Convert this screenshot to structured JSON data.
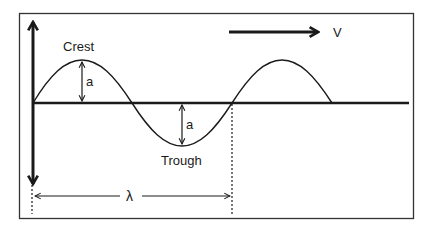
{
  "diagram": {
    "type": "transverse-wave",
    "labels": {
      "crest": "Crest",
      "trough": "Trough",
      "amplitude_top": "a",
      "amplitude_bottom": "a",
      "velocity": "V",
      "wavelength": "λ"
    },
    "colors": {
      "line": "#1a1a1a",
      "frame": "#333333",
      "background": "#ffffff"
    }
  }
}
